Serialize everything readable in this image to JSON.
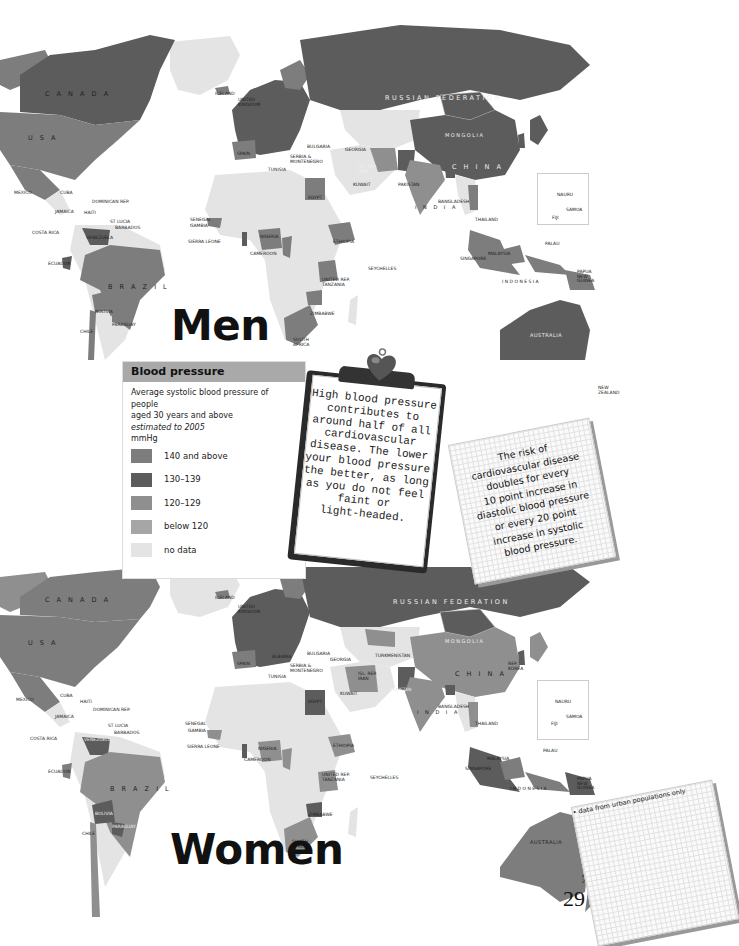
{
  "page_number": "29",
  "colors": {
    "c140_above": "#7d7d7d",
    "c130_139": "#5c5c5c",
    "c120_129": "#8f8f8f",
    "below_120": "#a6a6a6",
    "no_data": "#e4e4e4",
    "ocean": "#ffffff",
    "legend_header": "#a9a9a9"
  },
  "legend": {
    "title": "Blood pressure",
    "desc_line1": "Average systolic blood pressure of people",
    "desc_line2": "aged 30 years and above",
    "estimated": "estimated to 2005",
    "unit": "mmHg",
    "urban_note": "• data from urban populations only",
    "items": [
      {
        "label": "140 and above",
        "color": "#7d7d7d"
      },
      {
        "label": "130–139",
        "color": "#5c5c5c"
      },
      {
        "label": "120–129",
        "color": "#8f8f8f"
      },
      {
        "label": "below 120",
        "color": "#a6a6a6"
      },
      {
        "label": "no data",
        "color": "#e4e4e4"
      }
    ]
  },
  "clipboard": {
    "lines": [
      "High blood pressure",
      "contributes to",
      "around half of all",
      "cardiovascular",
      "disease. The lower",
      "your blood pressure",
      "the better, as long",
      "as you do not feel",
      "faint or",
      "light-headed."
    ]
  },
  "note_card": {
    "lines": [
      "The risk of",
      "cardiovascular disease",
      "doubles for every",
      "10 point increase in",
      "diastolic blood pressure",
      "or every 20 point",
      "increase in systolic",
      "blood pressure."
    ]
  },
  "maps": {
    "men": {
      "title": "Men",
      "labels": {
        "canada": "C A N A D A",
        "usa": "U S A",
        "russia": "RUSSIAN FEDERATION",
        "mongolia": "MONGOLIA",
        "china": "C H I N A",
        "india": "I N D I A",
        "brazil": "B R A Z I L",
        "australia": "AUSTRALIA",
        "indonesia": "I N D O N E S I A",
        "iceland": "ICELAND",
        "uk": "UNITED KINGDOM",
        "denmark": "DENMARK",
        "spain": "SPAIN",
        "serbia": "SERBIA & MONTENEGRO",
        "bulgaria": "BULGARIA",
        "georgia": "GEORGIA",
        "tunisia": "TUNISIA",
        "iran": "ISL. REP. IRAN",
        "kuwait": "KUWAIT",
        "pakistan": "PAKISTAN",
        "egypt": "EGYPT",
        "bangladesh": "BANGLADESH",
        "thailand": "THAILAND",
        "malaysia": "MALAYSIA",
        "singapore": "SINGAPORE",
        "png": "PAPUA NEW GUINEA",
        "palau": "PALAU",
        "nauru": "NAURU",
        "samoa": "SAMOA",
        "fiji": "FIJI",
        "nz": "NEW ZEALAND",
        "mexico": "MEXICO",
        "cuba": "CUBA",
        "jamaica": "JAMAICA",
        "haiti": "HAITI",
        "dominican": "DOMINICAN REP.",
        "stlucia": "ST LUCIA",
        "barbados": "BARBADOS",
        "costarica": "COSTA RICA",
        "venezuela": "VENEZUELA",
        "ecuador": "ECUADOR",
        "bolivia": "BOLIVIA",
        "paraguay": "PARAGUAY",
        "chile": "CHILE",
        "senegal": "SENEGAL",
        "gambia": "GAMBIA",
        "sierraleone": "SIERRA LEONE",
        "nigeria": "NIGERIA",
        "cameroon": "CAMEROON",
        "ethiopia": "ETHIOPIA",
        "tanzania": "UNITED REP. TANZANIA",
        "seychelles": "SEYCHELLES",
        "zimbabwe": "ZIMBABWE",
        "southafrica": "SOUTH AFRICA"
      }
    },
    "women": {
      "title": "Women",
      "labels": {
        "canada": "C A N A D A",
        "usa": "U S A",
        "russia": "RUSSIAN FEDERATION",
        "mongolia": "MONGOLIA",
        "china": "C H I N A",
        "india": "I N D I A",
        "brazil": "B R A Z I L",
        "australia": "AUSTRALIA",
        "indonesia": "I N D O N E S I A",
        "iceland": "ICELAND",
        "uk": "UNITED KINGDOM",
        "denmark": "DENMARK",
        "spain": "SPAIN",
        "serbia": "SERBIA & MONTENEGRO",
        "bulgaria": "BULGARIA",
        "georgia": "GEORGIA",
        "albania": "ALBANIA",
        "tunisia": "TUNISIA",
        "iran": "ISL. REP. IRAN",
        "kuwait": "KUWAIT",
        "pakistan": "PAKISTAN",
        "turkmenistan": "TURKMENISTAN",
        "egypt": "EGYPT",
        "bangladesh": "BANGLADESH",
        "thailand": "THAILAND",
        "malaysia": "MALAYSIA",
        "singapore": "SINGAPORE",
        "png": "PAPUA NEW GUINEA",
        "palau": "PALAU",
        "nauru": "NAURU",
        "samoa": "SAMOA",
        "fiji": "FIJI",
        "nz": "NEW ZEALAND",
        "korea": "REP. KOREA",
        "mexico": "MEXICO",
        "cuba": "CUBA",
        "jamaica": "JAMAICA",
        "haiti": "HAITI",
        "dominican": "DOMINICAN REP.",
        "stlucia": "ST LUCIA",
        "barbados": "BARBADOS",
        "costarica": "COSTA RICA",
        "venezuela": "VENEZUELA",
        "ecuador": "ECUADOR",
        "bolivia": "BOLIVIA",
        "paraguay": "PARAGUAY",
        "chile": "CHILE",
        "senegal": "SENEGAL",
        "gambia": "GAMBIA",
        "sierraleone": "SIERRA LEONE",
        "nigeria": "NIGERIA",
        "cameroon": "CAMEROON",
        "ethiopia": "ETHIOPIA",
        "tanzania": "UNITED REP. TANZANIA",
        "seychelles": "SEYCHELLES",
        "zimbabwe": "ZIMBABWE",
        "southafrica": "SOUTH AFRICA"
      }
    }
  }
}
